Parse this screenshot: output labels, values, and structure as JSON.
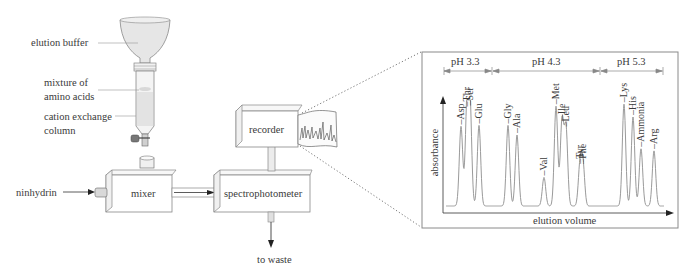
{
  "apparatus": {
    "labels": {
      "elution_buffer": "elution buffer",
      "mixture_line1": "mixture of",
      "mixture_line2": "amino acids",
      "column_line1": "cation exchange",
      "column_line2": "column",
      "ninhydrin": "ninhydrin",
      "mixer": "mixer",
      "spectrophotometer": "spectrophotometer",
      "recorder": "recorder",
      "to_waste": "to waste"
    }
  },
  "chromatogram": {
    "ph_regions": [
      {
        "label": "pH 3.3"
      },
      {
        "label": "pH 4.3"
      },
      {
        "label": "pH 5.3"
      }
    ],
    "ylabel": "absorbance",
    "xlabel": "elution volume",
    "colors": {
      "trace": "#9a9a9a",
      "axis": "#3a3a3a",
      "frame": "#8a8a8a"
    }
  },
  "chart_data": {
    "type": "line",
    "title": "",
    "xlabel": "elution volume",
    "ylabel": "absorbance",
    "regions": [
      {
        "label": "pH 3.3",
        "range_peaks": [
          "Asp",
          "Thr",
          "Ser",
          "Glu"
        ]
      },
      {
        "label": "pH 4.3",
        "range_peaks": [
          "Gly",
          "Ala",
          "Val",
          "Met",
          "Ile",
          "Leu",
          "Tyr",
          "Phe"
        ]
      },
      {
        "label": "pH 5.3",
        "range_peaks": [
          "Lys",
          "His",
          "Ammonia",
          "Arg"
        ]
      }
    ],
    "peaks": [
      {
        "label": "Asp",
        "x": 461,
        "height": 0.75
      },
      {
        "label": "Thr",
        "x": 467,
        "height": 0.92
      },
      {
        "label": "Ser",
        "x": 470,
        "height": 0.93
      },
      {
        "label": "Glu",
        "x": 479,
        "height": 0.76
      },
      {
        "label": "Gly",
        "x": 508,
        "height": 0.76
      },
      {
        "label": "Ala",
        "x": 517,
        "height": 0.67
      },
      {
        "label": "Val",
        "x": 544,
        "height": 0.27
      },
      {
        "label": "Met",
        "x": 556,
        "height": 0.94
      },
      {
        "label": "Ile",
        "x": 562,
        "height": 0.8
      },
      {
        "label": "Leu",
        "x": 566,
        "height": 0.73
      },
      {
        "label": "Tyr",
        "x": 580,
        "height": 0.38
      },
      {
        "label": "Phe",
        "x": 583,
        "height": 0.38
      },
      {
        "label": "Lys",
        "x": 624,
        "height": 0.96
      },
      {
        "label": "His",
        "x": 633,
        "height": 0.84
      },
      {
        "label": "Ammonia",
        "x": 641,
        "height": 0.54
      },
      {
        "label": "Arg",
        "x": 654,
        "height": 0.52
      }
    ],
    "grid": false,
    "legend": "none"
  }
}
